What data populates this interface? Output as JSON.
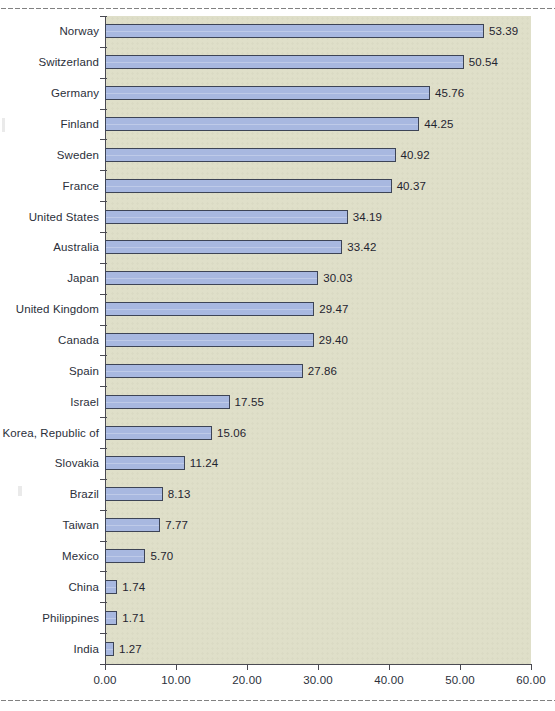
{
  "chart_data": {
    "type": "bar",
    "orientation": "horizontal",
    "title": "",
    "subtitle": "",
    "xlabel": "",
    "ylabel": "",
    "xlim": [
      0,
      60
    ],
    "xticks": [
      "0.00",
      "10.00",
      "20.00",
      "30.00",
      "40.00",
      "50.00",
      "60.00"
    ],
    "xtick_values": [
      0,
      10,
      20,
      30,
      40,
      50,
      60
    ],
    "grid": false,
    "legend": false,
    "categories": [
      "Norway",
      "Switzerland",
      "Germany",
      "Finland",
      "Sweden",
      "France",
      "United States",
      "Australia",
      "Japan",
      "United Kingdom",
      "Canada",
      "Spain",
      "Israel",
      "Korea, Republic of",
      "Slovakia",
      "Brazil",
      "Taiwan",
      "Mexico",
      "China",
      "Philippines",
      "India"
    ],
    "values": [
      53.39,
      50.54,
      45.76,
      44.25,
      40.92,
      40.37,
      34.19,
      33.42,
      30.03,
      29.47,
      29.4,
      27.86,
      17.55,
      15.06,
      11.24,
      8.13,
      7.77,
      5.7,
      1.74,
      1.71,
      1.27
    ],
    "data_labels": [
      "53.39",
      "50.54",
      "45.76",
      "44.25",
      "40.92",
      "40.37",
      "34.19",
      "33.42",
      "30.03",
      "29.47",
      "29.40",
      "27.86",
      "17.55",
      "15.06",
      "11.24",
      "8.13",
      "7.77",
      "5.70",
      "1.74",
      "1.71",
      "1.27"
    ]
  },
  "style": {
    "bar_fill": "#a8b8e0",
    "bar_stroke": "#3d4456",
    "plot_background": "#dfdfc9",
    "page_background": "#ffffff",
    "axis_color": "#4a4a52",
    "text_color": "#2b2f3a"
  }
}
